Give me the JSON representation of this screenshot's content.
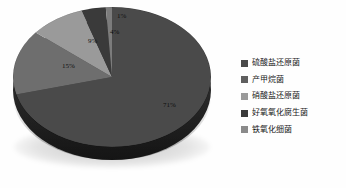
{
  "chart_data": {
    "type": "pie",
    "title": "",
    "subtitle": "",
    "xlabel": "",
    "ylabel": "",
    "grid": false,
    "legend_position": "right",
    "three_d": true,
    "categories": [
      "硫酸盐还原菌",
      "产甲烷菌",
      "硝酸盐还原菌",
      "好氧氧化腐生菌",
      "铁氧化细菌"
    ],
    "values": [
      71,
      15,
      9,
      4,
      1
    ],
    "value_unit": "%",
    "data_labels": [
      "71%",
      "15%",
      "9%",
      "4%",
      "1%"
    ],
    "colors": [
      "#4a4a4a",
      "#6e6e6e",
      "#9a9a9a",
      "#3a3a3a",
      "#7c7c7c"
    ],
    "slices": [
      {
        "label": "硫酸盐还原菌",
        "value": 71,
        "data_label": "71%",
        "color": "#4a4a4a"
      },
      {
        "label": "产甲烷菌",
        "value": 15,
        "data_label": "15%",
        "color": "#6e6e6e"
      },
      {
        "label": "硝酸盐还原菌",
        "value": 9,
        "data_label": "9%",
        "color": "#9a9a9a"
      },
      {
        "label": "好氧氧化腐生菌",
        "value": 4,
        "data_label": "4%",
        "color": "#3a3a3a"
      },
      {
        "label": "铁氧化细菌",
        "value": 1,
        "data_label": "1%",
        "color": "#7c7c7c"
      }
    ]
  },
  "legend": {
    "items": [
      {
        "label": "硫酸盐还原菌",
        "color": "#4a4a4a"
      },
      {
        "label": "产甲烷菌",
        "color": "#5f5f5f"
      },
      {
        "label": "硝酸盐还原菌",
        "color": "#9a9a9a"
      },
      {
        "label": "好氧氧化腐生菌",
        "color": "#3a3a3a"
      },
      {
        "label": "铁氧化细菌",
        "color": "#8a8a8a"
      }
    ]
  }
}
